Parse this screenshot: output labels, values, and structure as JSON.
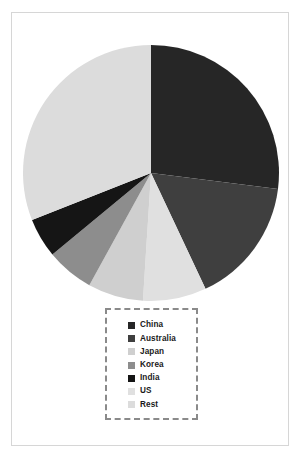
{
  "chart_data": {
    "type": "pie",
    "title": "",
    "subtitle": "",
    "xlabel": "",
    "ylabel": "",
    "grid": false,
    "legend_position": "bottom-center",
    "start_angle_deg": 0,
    "direction": "clockwise",
    "categories": [
      "China",
      "Australia",
      "Japan",
      "Korea",
      "India",
      "US",
      "Rest"
    ],
    "values": [
      27.0,
      16.0,
      7.0,
      6.0,
      5.0,
      8.0,
      31.0
    ],
    "colors": [
      "#262626",
      "#3f3f3f",
      "#cfcfcf",
      "#8d8d8d",
      "#151515",
      "#e0e0e0",
      "#dcdcdc"
    ],
    "slices": [
      {
        "label": "China",
        "value": 27.0,
        "color": "#262626",
        "order": 1
      },
      {
        "label": "Australia",
        "value": 16.0,
        "color": "#3f3f3f",
        "order": 2
      },
      {
        "label": "US",
        "value": 8.0,
        "color": "#e0e0e0",
        "order": 3
      },
      {
        "label": "Japan",
        "value": 7.0,
        "color": "#cfcfcf",
        "order": 4
      },
      {
        "label": "Korea",
        "value": 6.0,
        "color": "#8d8d8d",
        "order": 5
      },
      {
        "label": "India",
        "value": 5.0,
        "color": "#151515",
        "order": 6
      },
      {
        "label": "Rest",
        "value": 31.0,
        "color": "#dcdcdc",
        "order": 7
      }
    ]
  },
  "legend": {
    "items": [
      {
        "label": "China",
        "color": "#262626"
      },
      {
        "label": "Australia",
        "color": "#3f3f3f"
      },
      {
        "label": "Japan",
        "color": "#cfcfcf"
      },
      {
        "label": "Korea",
        "color": "#8d8d8d"
      },
      {
        "label": "India",
        "color": "#151515"
      },
      {
        "label": "US",
        "color": "#e0e0e0"
      },
      {
        "label": "Rest",
        "color": "#dcdcdc"
      }
    ]
  },
  "frame": {
    "border_color": "#d6d6d6",
    "legend_border_color": "#8a8a8a",
    "background": "#ffffff"
  }
}
